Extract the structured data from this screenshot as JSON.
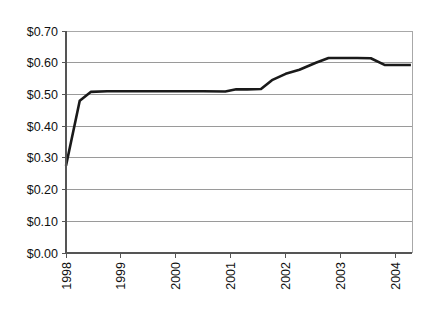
{
  "chart_data": {
    "type": "line",
    "title": "",
    "subtitle": "",
    "xlabel": "",
    "ylabel": "",
    "xlim": [
      1998,
      2004.3
    ],
    "ylim": [
      0.0,
      0.7
    ],
    "grid": true,
    "legend": false,
    "legend_position": "none",
    "y_tick_labels": [
      "$0.70",
      "$0.60",
      "$0.50",
      "$0.40",
      "$0.30",
      "$0.20",
      "$0.10",
      "$0.00"
    ],
    "y_tick_values": [
      0.7,
      0.6,
      0.5,
      0.4,
      0.3,
      0.2,
      0.1,
      0.0
    ],
    "x_tick_labels": [
      "1998",
      "1999",
      "2000",
      "2001",
      "2002",
      "2003",
      "2004"
    ],
    "x_tick_values": [
      1998,
      1999,
      2000,
      2001,
      2002,
      2003,
      2004
    ],
    "x_tick_rotation": 90,
    "currency_prefix": "$",
    "series": [
      {
        "name": "Price",
        "color": "#1a1a1a",
        "line_width": 2.6,
        "x": [
          1998.0,
          1998.25,
          1998.45,
          1998.75,
          1999.0,
          1999.5,
          2000.0,
          2000.5,
          2000.9,
          2001.1,
          2001.3,
          2001.55,
          2001.75,
          2002.0,
          2002.25,
          2002.55,
          2002.78,
          2003.0,
          2003.3,
          2003.55,
          2003.8,
          2004.0,
          2004.28
        ],
        "values": [
          0.275,
          0.48,
          0.508,
          0.51,
          0.51,
          0.51,
          0.51,
          0.51,
          0.509,
          0.516,
          0.516,
          0.517,
          0.545,
          0.565,
          0.578,
          0.6,
          0.615,
          0.615,
          0.615,
          0.614,
          0.593,
          0.593,
          0.593
        ]
      }
    ],
    "annotations": []
  },
  "axes": {
    "y_axis_name": "price-axis",
    "x_axis_name": "year-axis"
  }
}
